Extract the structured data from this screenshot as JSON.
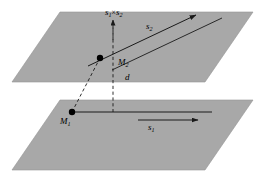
{
  "figure": {
    "background_color": "#ffffff",
    "plane_fill": "#a8a8a8",
    "plane_stroke": "#8f8f8f",
    "line_color": "#1a1a1a"
  },
  "labels": {
    "cross_product": {
      "base": "s",
      "sub1": "1",
      "operator": "×",
      "base2": "s",
      "sub2": "2"
    },
    "direction_upper": {
      "base": "s",
      "sub": "2"
    },
    "point_upper": {
      "base": "M",
      "sub": "2"
    },
    "distance": {
      "text": "d"
    },
    "point_lower": {
      "base": "M",
      "sub": "1"
    },
    "direction_lower": {
      "base": "s",
      "sub": "1"
    }
  },
  "geometry": {
    "upper_plane_points": "60,12 253,12 205,82 12,82",
    "lower_plane_points": "60,100 253,100 205,170 12,170",
    "upper_line": {
      "x1": 96,
      "y1": 62,
      "x2": 196,
      "y2": 15
    },
    "lower_line": {
      "x1": 72,
      "y1": 112,
      "x2": 210,
      "y2": 112
    },
    "vertical_dashed": {
      "x1": 113,
      "y1": 22,
      "x2": 113,
      "y2": 112
    },
    "connector_dashed": {
      "x1": 72,
      "y1": 112,
      "x2": 100,
      "y2": 58
    },
    "point_m2": {
      "cx": 100,
      "cy": 58,
      "r": 3.2
    },
    "point_m1": {
      "cx": 72,
      "cy": 112,
      "r": 3.2
    }
  }
}
